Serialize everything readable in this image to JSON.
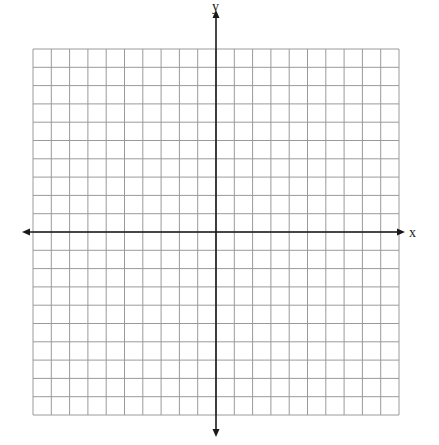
{
  "diagram": {
    "type": "coordinate-plane",
    "x_axis_label": "x",
    "y_axis_label": "y",
    "grid": {
      "cols_left": 10,
      "cols_right": 10,
      "rows_above": 10,
      "rows_below": 10,
      "left": 33,
      "top": 49,
      "cell": 18.3
    },
    "origin": {
      "x": 216,
      "y": 232
    },
    "x_axis_extent": [
      22,
      405
    ],
    "y_axis_extent": [
      10,
      437
    ],
    "colors": {
      "grid_line": "#9a9a9a",
      "axis": "#1a1a1a",
      "background": "#ffffff"
    }
  }
}
